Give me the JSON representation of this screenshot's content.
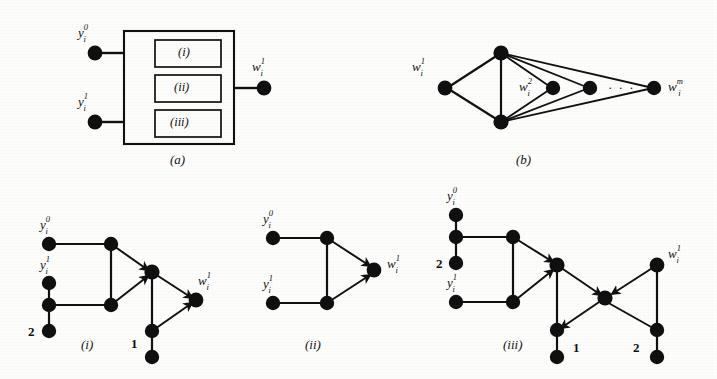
{
  "figure": {
    "kind": "graph-gadget-figure",
    "background_color": "#fdfdfc",
    "ink_color": "#111111",
    "node_color": "#101010",
    "panels": [
      {
        "id": "a",
        "label": "(a)"
      },
      {
        "id": "b",
        "label": "(b)"
      },
      {
        "id": "i",
        "label": "(i)"
      },
      {
        "id": "ii",
        "label": "(ii)"
      },
      {
        "id": "iii",
        "label": "(iii)"
      }
    ]
  },
  "panel_a": {
    "caption": "(a)",
    "inner_boxes": [
      {
        "label": "(i)"
      },
      {
        "label": "(ii)"
      },
      {
        "label": "(iii)"
      }
    ],
    "input_labels": [
      {
        "base": "y",
        "sub": "i",
        "sup": "0"
      },
      {
        "base": "y",
        "sub": "i",
        "sup": "1"
      }
    ],
    "output_label": {
      "base": "w",
      "sub": "i",
      "sup": "1"
    }
  },
  "panel_b": {
    "caption": "(b)",
    "labels": [
      {
        "base": "w",
        "sub": "i",
        "sup": "1"
      },
      {
        "base": "w",
        "sub": "i",
        "sup": "2"
      },
      {
        "base": "w",
        "sub": "i",
        "sup": "m"
      }
    ],
    "ellipsis": "· · ·"
  },
  "panel_i": {
    "caption": "(i)",
    "labels": [
      {
        "base": "y",
        "sub": "i",
        "sup": "0"
      },
      {
        "base": "y",
        "sub": "i",
        "sup": "1"
      },
      {
        "base": "w",
        "sub": "i",
        "sup": "1"
      }
    ],
    "numeric_labels": [
      "2",
      "1"
    ]
  },
  "panel_ii": {
    "caption": "(ii)",
    "labels": [
      {
        "base": "y",
        "sub": "i",
        "sup": "0"
      },
      {
        "base": "y",
        "sub": "i",
        "sup": "1"
      },
      {
        "base": "w",
        "sub": "i",
        "sup": "1"
      }
    ],
    "numeric_labels": []
  },
  "panel_iii": {
    "caption": "(iii)",
    "labels": [
      {
        "base": "y",
        "sub": "i",
        "sup": "0"
      },
      {
        "base": "y",
        "sub": "i",
        "sup": "1"
      },
      {
        "base": "w",
        "sub": "i",
        "sup": "1"
      }
    ],
    "numeric_labels": [
      "2",
      "1",
      "2"
    ]
  }
}
